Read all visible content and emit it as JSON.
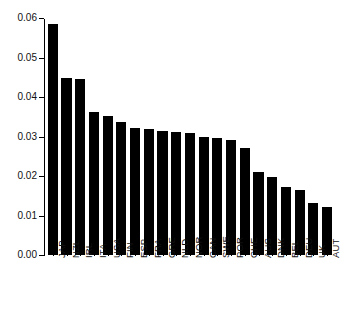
{
  "chart_data": {
    "type": "bar",
    "title": "",
    "subtitle": "",
    "xlabel": "",
    "ylabel": "",
    "ylim": [
      0,
      0.06
    ],
    "xlim": [
      0,
      21
    ],
    "grid": false,
    "legend": null,
    "bar_color": "#000000",
    "axis_color": "#000000",
    "background": "#ffffff",
    "y_ticks": [
      "0.00",
      "0.01",
      "0.02",
      "0.03",
      "0.04",
      "0.05",
      "0.06"
    ],
    "y_tick_values": [
      0.0,
      0.01,
      0.02,
      0.03,
      0.04,
      0.05,
      0.06
    ],
    "categories": [
      "JAP",
      "NZL",
      "IRL",
      "ITA",
      "USA",
      "FIN",
      "ESP",
      "FRA",
      "GRE",
      "NLD",
      "NOR",
      "CAN",
      "SWE",
      "POR",
      "CHE",
      "AUS",
      "DNK",
      "BEL",
      "DEU",
      "UK",
      "AUT"
    ],
    "values": [
      0.0585,
      0.0449,
      0.0445,
      0.0362,
      0.0352,
      0.0336,
      0.0322,
      0.0319,
      0.0315,
      0.0311,
      0.0309,
      0.03,
      0.0295,
      0.0292,
      0.0271,
      0.0211,
      0.0198,
      0.0171,
      0.0165,
      0.0131,
      0.0121
    ]
  },
  "caption": {
    "text": ""
  }
}
